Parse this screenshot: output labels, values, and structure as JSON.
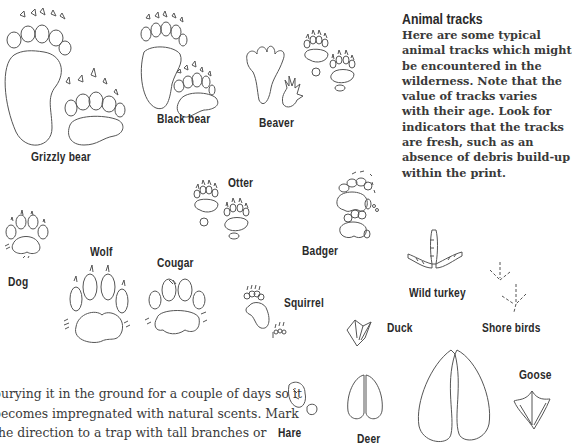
{
  "sidebar": {
    "title": "Animal tracks",
    "lines": [
      "Here are some typical",
      "animal tracks which might",
      "be encountered in the",
      "wilderness. Note that the",
      "value of tracks varies",
      "with their age. Look for",
      "indicators that the tracks",
      "are fresh, such as an",
      "absence of debris build-up",
      "within the print."
    ]
  },
  "body_text": {
    "lines": [
      "burying it in the ground for a couple of days so it",
      "becomes impregnated with natural scents. Mark",
      "the direction to a trap with tall branches or"
    ]
  },
  "tracks": {
    "grizzly_bear": "Grizzly bear",
    "black_bear": "Black bear",
    "beaver": "Beaver",
    "otter": "Otter",
    "badger": "Badger",
    "dog": "Dog",
    "wolf": "Wolf",
    "cougar": "Cougar",
    "squirrel": "Squirrel",
    "wild_turkey": "Wild turkey",
    "duck": "Duck",
    "shore_birds": "Shore birds",
    "hare": "Hare",
    "deer": "Deer",
    "goose": "Goose"
  }
}
